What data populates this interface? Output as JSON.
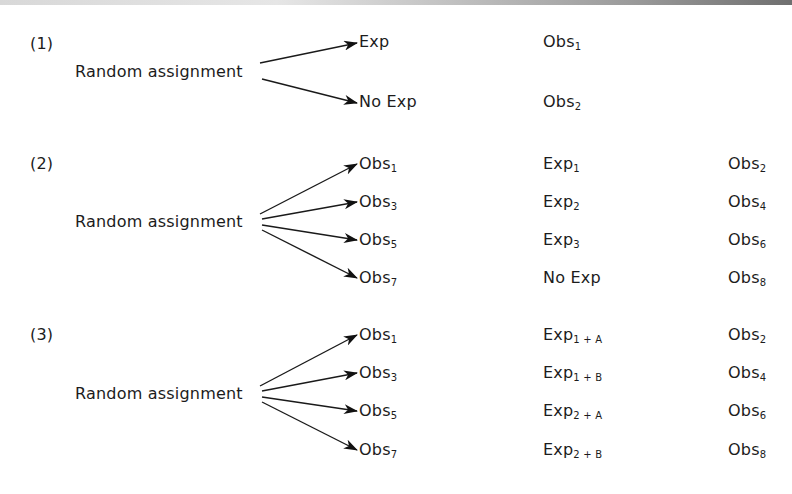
{
  "designs": [
    {
      "label": "(1)",
      "source": "Random assignment",
      "rows": [
        {
          "branch": {
            "base": "Exp",
            "sub": ""
          },
          "col2": {
            "base": "Obs",
            "sub": "1"
          },
          "col3": {
            "base": "",
            "sub": ""
          }
        },
        {
          "branch": {
            "base": "No Exp",
            "sub": ""
          },
          "col2": {
            "base": "Obs",
            "sub": "2"
          },
          "col3": {
            "base": "",
            "sub": ""
          }
        }
      ]
    },
    {
      "label": "(2)",
      "source": "Random assignment",
      "rows": [
        {
          "branch": {
            "base": "Obs",
            "sub": "1"
          },
          "col2": {
            "base": "Exp",
            "sub": "1"
          },
          "col3": {
            "base": "Obs",
            "sub": "2"
          }
        },
        {
          "branch": {
            "base": "Obs",
            "sub": "3"
          },
          "col2": {
            "base": "Exp",
            "sub": "2"
          },
          "col3": {
            "base": "Obs",
            "sub": "4"
          }
        },
        {
          "branch": {
            "base": "Obs",
            "sub": "5"
          },
          "col2": {
            "base": "Exp",
            "sub": "3"
          },
          "col3": {
            "base": "Obs",
            "sub": "6"
          }
        },
        {
          "branch": {
            "base": "Obs",
            "sub": "7"
          },
          "col2": {
            "base": "No Exp",
            "sub": ""
          },
          "col3": {
            "base": "Obs",
            "sub": "8"
          }
        }
      ]
    },
    {
      "label": "(3)",
      "source": "Random assignment",
      "rows": [
        {
          "branch": {
            "base": "Obs",
            "sub": "1"
          },
          "col2": {
            "base": "Exp",
            "sub": "1 + A"
          },
          "col3": {
            "base": "Obs",
            "sub": "2"
          }
        },
        {
          "branch": {
            "base": "Obs",
            "sub": "3"
          },
          "col2": {
            "base": "Exp",
            "sub": "1 + B"
          },
          "col3": {
            "base": "Obs",
            "sub": "4"
          }
        },
        {
          "branch": {
            "base": "Obs",
            "sub": "5"
          },
          "col2": {
            "base": "Exp",
            "sub": "2 + A"
          },
          "col3": {
            "base": "Obs",
            "sub": "6"
          }
        },
        {
          "branch": {
            "base": "Obs",
            "sub": "7"
          },
          "col2": {
            "base": "Exp",
            "sub": "2 + B"
          },
          "col3": {
            "base": "Obs",
            "sub": "8"
          }
        }
      ]
    }
  ]
}
